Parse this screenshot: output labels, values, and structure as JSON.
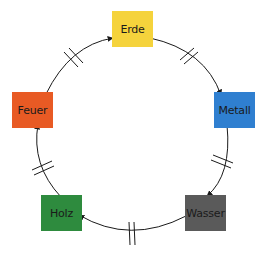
{
  "diagram": {
    "type": "cycle",
    "nodes": [
      {
        "id": "erde",
        "label": "Erde",
        "color": "#f5d33c",
        "x": 112,
        "y": 11
      },
      {
        "id": "metall",
        "label": "Metall",
        "color": "#2f7fd0",
        "x": 214,
        "y": 92
      },
      {
        "id": "wasser",
        "label": "Wasser",
        "color": "#5a5a5a",
        "x": 185,
        "y": 195
      },
      {
        "id": "holz",
        "label": "Holz",
        "color": "#2e8b3e",
        "x": 41,
        "y": 195
      },
      {
        "id": "feuer",
        "label": "Feuer",
        "color": "#e85a24",
        "x": 12,
        "y": 92
      }
    ],
    "edges": [
      {
        "from": "erde",
        "to": "metall",
        "marker": "double-tick"
      },
      {
        "from": "metall",
        "to": "wasser",
        "marker": "double-tick"
      },
      {
        "from": "wasser",
        "to": "holz",
        "marker": "double-tick"
      },
      {
        "from": "holz",
        "to": "feuer",
        "marker": "double-tick"
      },
      {
        "from": "feuer",
        "to": "erde",
        "marker": "double-tick"
      }
    ],
    "line_color": "#1a1a1a"
  }
}
